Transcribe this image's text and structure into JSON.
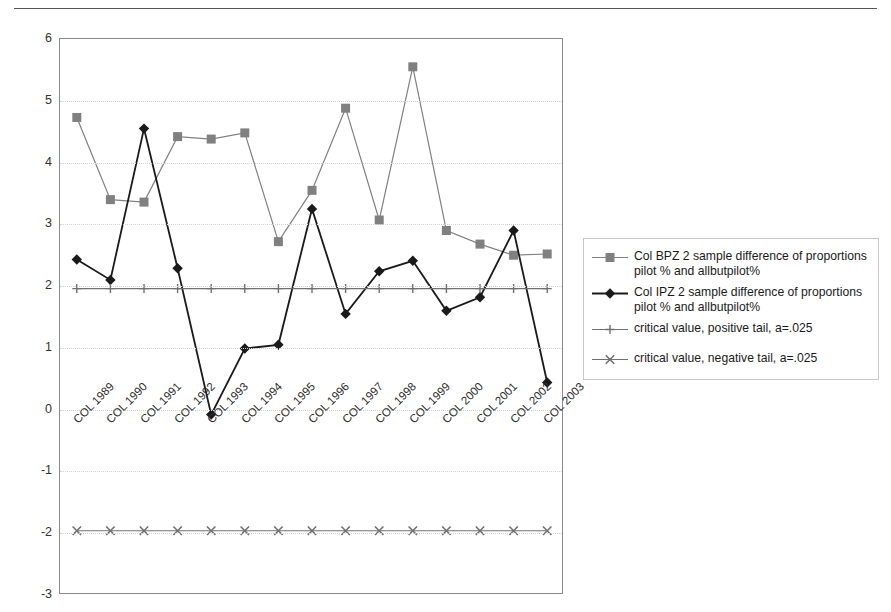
{
  "chart_data": {
    "type": "line",
    "title": "",
    "xlabel": "",
    "ylabel": "",
    "ylim": [
      -3,
      6
    ],
    "yticks": [
      6,
      5,
      4,
      3,
      2,
      1,
      0,
      -1,
      -2,
      -3
    ],
    "grid": true,
    "legend_position": "right",
    "categories": [
      "COL 1989",
      "COL 1990",
      "COL 1991",
      "COL 1992",
      "COL 1993",
      "COL 1994",
      "COL 1995",
      "COL 1996",
      "COL 1997",
      "COL 1998",
      "COL 1999",
      "COL 2000",
      "COL 2001",
      "COL 2002",
      "COL 2003"
    ],
    "series": [
      {
        "name": "Col BPZ 2 sample difference of proportions pilot % and allbutpilot%",
        "marker": "square",
        "color": "#808080",
        "values": [
          4.73,
          3.4,
          3.36,
          4.42,
          4.38,
          4.48,
          2.72,
          3.55,
          4.88,
          3.07,
          5.55,
          2.9,
          2.68,
          2.5,
          2.52
        ]
      },
      {
        "name": "Col IPZ 2 sample difference of proportions pilot % and allbutpilot%",
        "marker": "diamond",
        "color": "#1a1a1a",
        "values": [
          2.43,
          2.1,
          4.55,
          2.29,
          -0.08,
          0.99,
          1.05,
          3.25,
          1.55,
          2.24,
          2.41,
          1.6,
          1.82,
          2.9,
          0.44
        ]
      },
      {
        "name": "critical value, positive tail, a=.025",
        "marker": "plus",
        "color": "#707070",
        "values": [
          1.96,
          1.96,
          1.96,
          1.96,
          1.96,
          1.96,
          1.96,
          1.96,
          1.96,
          1.96,
          1.96,
          1.96,
          1.96,
          1.96,
          1.96
        ]
      },
      {
        "name": "critical value, negative tail, a=.025",
        "marker": "cross",
        "color": "#707070",
        "values": [
          -1.96,
          -1.96,
          -1.96,
          -1.96,
          -1.96,
          -1.96,
          -1.96,
          -1.96,
          -1.96,
          -1.96,
          -1.96,
          -1.96,
          -1.96,
          -1.96,
          -1.96
        ]
      }
    ]
  },
  "legend": {
    "entries": [
      {
        "label": "Col BPZ 2 sample difference of proportions\npilot % and allbutpilot%",
        "marker": "square"
      },
      {
        "label": "Col IPZ 2 sample difference of proportions\npilot % and allbutpilot%",
        "marker": "diamond"
      },
      {
        "label": "critical value, positive tail, a=.025",
        "marker": "plus"
      },
      {
        "label": "critical value, negative tail, a=.025",
        "marker": "cross"
      }
    ]
  },
  "axis": {
    "y_tick_labels": [
      "6",
      "5",
      "4",
      "3",
      "2",
      "1",
      "0",
      "-1",
      "-2",
      "-3"
    ]
  }
}
